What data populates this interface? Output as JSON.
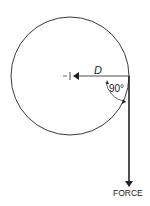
{
  "diagram": {
    "distance_label": "D",
    "angle_label": "90°",
    "force_label": "FORCE",
    "stroke_color": "#222222",
    "background": "#ffffff"
  }
}
